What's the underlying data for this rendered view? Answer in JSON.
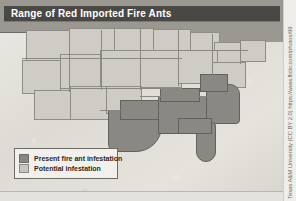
{
  "header": {
    "title": "Range of Red Imported Fire Ants"
  },
  "map": {
    "name": "united-states-fire-ant-range-map",
    "colors": {
      "present_infestation": "#8a8882",
      "potential_infestation": "#c9c6bf",
      "land": "#cfccc5",
      "canada": "#9a9891",
      "ocean": "#e2dfd9",
      "border": "#8a8881",
      "title_bar": "#4a4845",
      "legend_background": "#f2f0ec"
    }
  },
  "legend": {
    "items": [
      {
        "label": "Present fire ant infestation",
        "swatch_color": "#8a8882",
        "swatch_name": "present-infestation-swatch"
      },
      {
        "label": "Potential infestation",
        "swatch_color": "#c9c6bf",
        "swatch_name": "potential-infestation-swatch"
      }
    ]
  },
  "attribution": {
    "text": "Texas A&M University (CC BY 2.0) https://www.flickr.com/photos/99"
  }
}
